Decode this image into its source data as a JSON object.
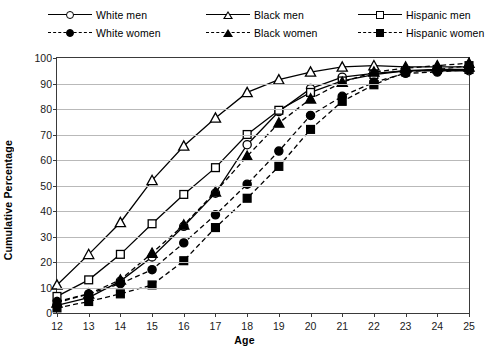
{
  "chart_data": {
    "type": "line",
    "title": "",
    "xlabel": "Age",
    "ylabel": "Cumulative Percentage",
    "xlim": [
      12,
      25
    ],
    "ylim": [
      0,
      100
    ],
    "grid": true,
    "legend_position": "top",
    "x": [
      12,
      13,
      14,
      15,
      16,
      17,
      18,
      19,
      20,
      21,
      22,
      23,
      24,
      25
    ],
    "xticks": [
      "12",
      "13",
      "14",
      "15",
      "16",
      "17",
      "18",
      "19",
      "20",
      "21",
      "22",
      "23",
      "24",
      "25"
    ],
    "yticks": [
      "0",
      "10",
      "20",
      "30",
      "40",
      "50",
      "60",
      "70",
      "80",
      "90",
      "100"
    ],
    "series": [
      {
        "name": "White men",
        "marker": "circle-open",
        "line": "solid",
        "values": [
          3,
          6,
          12.5,
          22,
          34,
          47,
          66,
          79,
          88,
          92.5,
          94,
          95,
          95,
          95
        ]
      },
      {
        "name": "Black men",
        "marker": "triangle-open",
        "line": "solid",
        "values": [
          11,
          23,
          35.5,
          52,
          65.5,
          76.5,
          86.5,
          91.5,
          94.5,
          96.5,
          97,
          96.5,
          96.5,
          96.5
        ]
      },
      {
        "name": "Hispanic men",
        "marker": "square-open",
        "line": "solid",
        "values": [
          6.5,
          13,
          23,
          35,
          46.5,
          57,
          70,
          79.5,
          86.5,
          91,
          93.5,
          95,
          95.5,
          95.5
        ]
      },
      {
        "name": "White women",
        "marker": "circle-filled",
        "line": "dashed",
        "values": [
          4.5,
          7.5,
          11.5,
          17,
          27.5,
          38.5,
          50.5,
          63.5,
          77.5,
          85,
          90.5,
          94,
          94.5,
          95.5
        ]
      },
      {
        "name": "Black women",
        "marker": "triangle-filled",
        "line": "dashed",
        "values": [
          4,
          7.5,
          13,
          23.5,
          34.5,
          47.5,
          61.5,
          74.5,
          84,
          90.5,
          94.5,
          96,
          97,
          98
        ]
      },
      {
        "name": "Hispanic women",
        "marker": "square-filled",
        "line": "dashed",
        "values": [
          2,
          4.5,
          7.5,
          11,
          20.5,
          33.5,
          45,
          57.5,
          72,
          83,
          89.5,
          94.5,
          95.5,
          97
        ]
      }
    ]
  },
  "legend": {
    "items": [
      {
        "label": "White men",
        "marker": "circle-open",
        "line": "solid",
        "col": 0,
        "row": 0
      },
      {
        "label": "White women",
        "marker": "circle-filled",
        "line": "dashed",
        "col": 0,
        "row": 1
      },
      {
        "label": "Black men",
        "marker": "triangle-open",
        "line": "solid",
        "col": 1,
        "row": 0
      },
      {
        "label": "Black women",
        "marker": "triangle-filled",
        "line": "dashed",
        "col": 1,
        "row": 1
      },
      {
        "label": "Hispanic men",
        "marker": "square-open",
        "line": "solid",
        "col": 2,
        "row": 0
      },
      {
        "label": "Hispanic women",
        "marker": "square-filled",
        "line": "dashed",
        "col": 2,
        "row": 1
      }
    ]
  },
  "colors": {
    "line": "#000000",
    "grid": "#b9b9b9",
    "axis": "#3a3a3a",
    "background": "#ffffff"
  }
}
